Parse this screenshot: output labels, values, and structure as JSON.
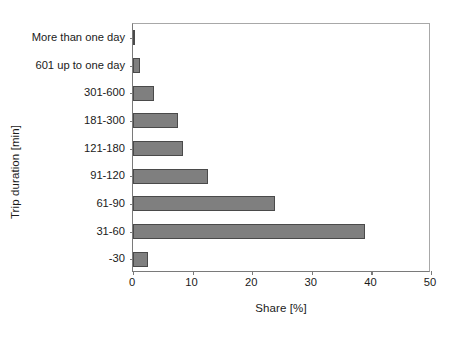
{
  "chart_data": {
    "type": "bar",
    "orientation": "horizontal",
    "title": "",
    "xlabel": "Share [%]",
    "ylabel": "Trip duration [min]",
    "xlim": [
      0,
      50
    ],
    "xticks": [
      0,
      10,
      20,
      30,
      40,
      50
    ],
    "xtick_labels": [
      "0",
      "10",
      "20",
      "30",
      "40",
      "50"
    ],
    "grid": false,
    "legend": null,
    "bar_color": "#7f7f7f",
    "bar_edge_color": "#4a4a4a",
    "axis_color": "#7a7a7a",
    "categories": [
      "More than one day",
      "601 up to one day",
      "301-600",
      "181-300",
      "121-180",
      "91-120",
      "61-90",
      "31-60",
      "-30"
    ],
    "values": [
      0.3,
      1.2,
      3.6,
      7.5,
      8.4,
      12.5,
      23.8,
      39.0,
      2.5
    ],
    "series": [
      {
        "name": "Share",
        "values": [
          0.3,
          1.2,
          3.6,
          7.5,
          8.4,
          12.5,
          23.8,
          39.0,
          2.5
        ]
      }
    ]
  }
}
